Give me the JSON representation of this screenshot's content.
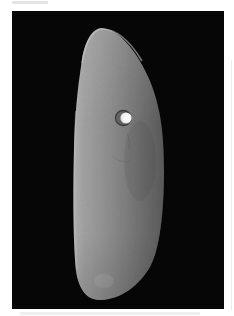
{
  "figure": {
    "kind": "photograph",
    "background_color": "#060606",
    "page_color": "#ffffff",
    "stone": {
      "highlight_color": "#b8b8b8",
      "light_color": "#9a9a9a",
      "mid_color": "#808080",
      "shadow_color": "#5e5e5e",
      "hole": {
        "center": [
          125,
          118
        ],
        "radius": 6,
        "inner_color": "#f4f4f4",
        "rim_color": "#3a3a3a"
      }
    }
  }
}
